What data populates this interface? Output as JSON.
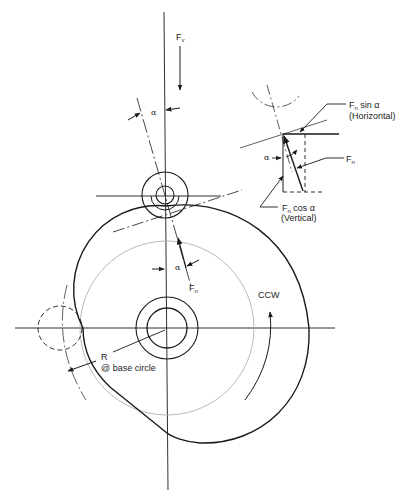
{
  "diagram": {
    "colors": {
      "line": "#1a1a1a",
      "base_circle": "#b0b0b0",
      "background": "#ffffff"
    }
  },
  "labels": {
    "fv_main": "F",
    "fv_sub": "v",
    "alpha_top": "α",
    "alpha_mid": "α",
    "fn_main": "F",
    "fn_sub": "n",
    "ccw": "CCW",
    "r_label": "R",
    "base_circle": "@ base circle"
  },
  "inset": {
    "fn_sin_main": "F",
    "fn_sin_sub": "n",
    "fn_sin_text": " sin α",
    "horizontal": "(Horizontal)",
    "fn_main": "F",
    "fn_sub": "n",
    "alpha": "α",
    "fn_cos_main": "F",
    "fn_cos_sub": "n",
    "fn_cos_text": " cos α",
    "vertical": "(Vertical)"
  }
}
